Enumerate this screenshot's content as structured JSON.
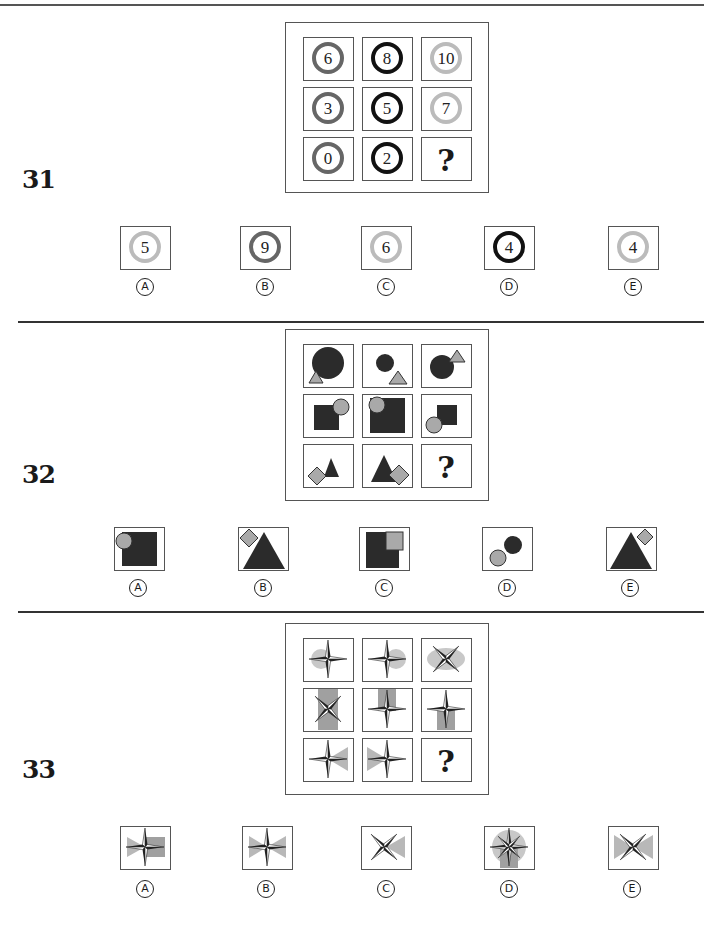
{
  "questions": [
    {
      "number": "31",
      "grid": [
        [
          {
            "n": "6",
            "ring": "#666666"
          },
          {
            "n": "8",
            "ring": "#111111"
          },
          {
            "n": "10",
            "ring": "#bbbbbb"
          }
        ],
        [
          {
            "n": "3",
            "ring": "#666666"
          },
          {
            "n": "5",
            "ring": "#111111"
          },
          {
            "n": "7",
            "ring": "#bbbbbb"
          }
        ],
        [
          {
            "n": "0",
            "ring": "#666666"
          },
          {
            "n": "2",
            "ring": "#111111"
          },
          {
            "n": "?",
            "ring": null
          }
        ]
      ],
      "options": [
        {
          "label": "A",
          "n": "5",
          "ring": "#bbbbbb"
        },
        {
          "label": "B",
          "n": "9",
          "ring": "#666666"
        },
        {
          "label": "C",
          "n": "6",
          "ring": "#bbbbbb"
        },
        {
          "label": "D",
          "n": "4",
          "ring": "#111111"
        },
        {
          "label": "E",
          "n": "4",
          "ring": "#bbbbbb"
        }
      ]
    },
    {
      "number": "32",
      "grid_description": "Row1: dark circle + grey triangle; Row2: dark square + grey circle; Row3: dark triangle + grey diamond",
      "options": [
        {
          "label": "A",
          "desc": "dark square with grey circle top-left"
        },
        {
          "label": "B",
          "desc": "dark triangle with grey diamond top-left"
        },
        {
          "label": "C",
          "desc": "dark square with grey square top-right"
        },
        {
          "label": "D",
          "desc": "dark circle with grey circle bottom-left"
        },
        {
          "label": "E",
          "desc": "dark triangle with grey diamond top-right"
        }
      ]
    },
    {
      "number": "33",
      "grid_description": "Four-point compass stars with grey backgrounds (circle, vertical bar, bow-tie triangles)",
      "options": [
        {
          "label": "A",
          "desc": "plus star, left triangle + right rectangle"
        },
        {
          "label": "B",
          "desc": "plus star, bow-tie triangles"
        },
        {
          "label": "C",
          "desc": "x star, right triangle"
        },
        {
          "label": "D",
          "desc": "8-point star, circle and bar"
        },
        {
          "label": "E",
          "desc": "x star, bow-tie triangles"
        }
      ]
    }
  ],
  "question_mark": "?",
  "colors": {
    "dark": "#2b2b2b",
    "grey": "#a9a9a9",
    "light": "#c8c8c8",
    "border": "#555555"
  }
}
